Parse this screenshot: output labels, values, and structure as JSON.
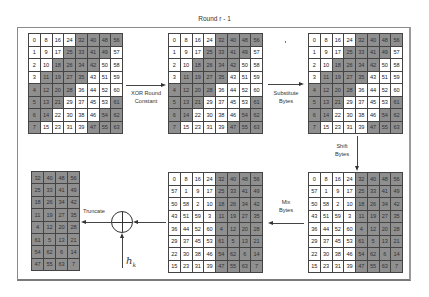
{
  "title": "Round r - 1",
  "colors": {
    "shaded": "#8f8f8f",
    "white": "#ffffff",
    "line": "#444444"
  },
  "steps": {
    "xor_round_constant": [
      "XOR Round",
      "Constant"
    ],
    "substitute_bytes": [
      "Substitute",
      "Bytes"
    ],
    "shift_bytes": [
      "Shift",
      "Bytes"
    ],
    "mix_bytes": [
      "Mix",
      "Bytes"
    ],
    "truncate": "Truncate",
    "hk_label": "h",
    "hk_sub": "k",
    "xor_symbol": "xor-circle-plus"
  },
  "grids": {
    "state_initial": {
      "values": [
        [
          0,
          8,
          16,
          24,
          32,
          40,
          48,
          56
        ],
        [
          1,
          9,
          17,
          25,
          33,
          41,
          49,
          57
        ],
        [
          2,
          10,
          18,
          26,
          34,
          42,
          50,
          58
        ],
        [
          3,
          11,
          19,
          27,
          35,
          43,
          51,
          59
        ],
        [
          4,
          12,
          20,
          28,
          36,
          44,
          52,
          60
        ],
        [
          5,
          13,
          21,
          29,
          37,
          45,
          53,
          61
        ],
        [
          6,
          14,
          22,
          30,
          38,
          46,
          54,
          62
        ],
        [
          7,
          15,
          23,
          31,
          39,
          47,
          55,
          63
        ]
      ],
      "shaded": [
        [
          0,
          0,
          0,
          0,
          1,
          1,
          1,
          1
        ],
        [
          0,
          0,
          0,
          1,
          1,
          1,
          1,
          0
        ],
        [
          0,
          0,
          1,
          1,
          1,
          1,
          0,
          0
        ],
        [
          0,
          1,
          1,
          1,
          1,
          0,
          0,
          0
        ],
        [
          1,
          1,
          1,
          1,
          0,
          0,
          0,
          0
        ],
        [
          1,
          1,
          1,
          0,
          0,
          0,
          0,
          1
        ],
        [
          1,
          1,
          0,
          0,
          0,
          0,
          1,
          1
        ],
        [
          1,
          0,
          0,
          0,
          0,
          1,
          1,
          1
        ]
      ]
    },
    "state_shifted": {
      "values": [
        [
          0,
          8,
          16,
          24,
          32,
          40,
          48,
          56
        ],
        [
          57,
          1,
          9,
          17,
          25,
          33,
          41,
          49
        ],
        [
          50,
          58,
          2,
          10,
          18,
          26,
          34,
          42
        ],
        [
          43,
          51,
          59,
          3,
          11,
          19,
          27,
          35
        ],
        [
          36,
          44,
          52,
          60,
          4,
          12,
          20,
          28
        ],
        [
          29,
          37,
          45,
          53,
          61,
          5,
          13,
          21
        ],
        [
          22,
          30,
          38,
          46,
          54,
          62,
          6,
          14
        ],
        [
          15,
          23,
          31,
          39,
          47,
          55,
          63,
          7
        ]
      ],
      "shaded": [
        [
          0,
          0,
          0,
          0,
          1,
          1,
          1,
          1
        ],
        [
          0,
          0,
          0,
          0,
          1,
          1,
          1,
          1
        ],
        [
          0,
          0,
          0,
          0,
          1,
          1,
          1,
          1
        ],
        [
          0,
          0,
          0,
          0,
          1,
          1,
          1,
          1
        ],
        [
          0,
          0,
          0,
          0,
          1,
          1,
          1,
          1
        ],
        [
          0,
          0,
          0,
          0,
          1,
          1,
          1,
          1
        ],
        [
          0,
          0,
          0,
          0,
          1,
          1,
          1,
          1
        ],
        [
          0,
          0,
          0,
          0,
          1,
          1,
          1,
          1
        ]
      ]
    },
    "state_truncated": {
      "values": [
        [
          32,
          40,
          48,
          56
        ],
        [
          25,
          33,
          41,
          49
        ],
        [
          18,
          26,
          34,
          42
        ],
        [
          11,
          19,
          27,
          35
        ],
        [
          4,
          12,
          20,
          28
        ],
        [
          61,
          5,
          13,
          21
        ],
        [
          54,
          62,
          6,
          14
        ],
        [
          47,
          55,
          63,
          7
        ]
      ],
      "shaded": [
        [
          1,
          1,
          1,
          1
        ],
        [
          1,
          1,
          1,
          1
        ],
        [
          1,
          1,
          1,
          1
        ],
        [
          1,
          1,
          1,
          1
        ],
        [
          1,
          1,
          1,
          1
        ],
        [
          1,
          1,
          1,
          1
        ],
        [
          1,
          1,
          1,
          1
        ],
        [
          1,
          1,
          1,
          1
        ]
      ]
    }
  },
  "layout_grids": [
    {
      "name": "grid-input-state",
      "source": "state_initial",
      "cls": "g8",
      "left": 28,
      "top": 33
    },
    {
      "name": "grid-after-xor-constant",
      "source": "state_initial",
      "cls": "g8",
      "left": 168,
      "top": 33
    },
    {
      "name": "grid-after-substitute-bytes",
      "source": "state_initial",
      "cls": "g8",
      "left": 308,
      "top": 33
    },
    {
      "name": "grid-after-shift-bytes",
      "source": "state_shifted",
      "cls": "g8",
      "left": 308,
      "top": 172
    },
    {
      "name": "grid-after-mix-bytes",
      "source": "state_shifted",
      "cls": "g8",
      "left": 168,
      "top": 172
    },
    {
      "name": "grid-truncated-output",
      "source": "state_truncated",
      "cls": "g4",
      "left": 31,
      "top": 171
    }
  ]
}
